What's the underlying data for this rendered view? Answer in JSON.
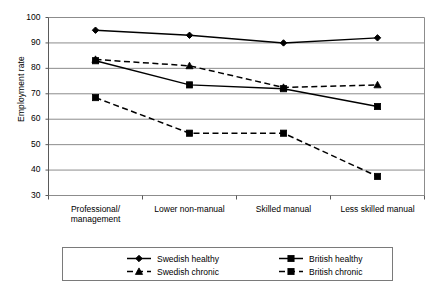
{
  "chart_data": {
    "type": "line",
    "title": "",
    "xlabel": "",
    "ylabel": "Employment rate",
    "ylim": [
      30,
      100
    ],
    "ytick_step": 10,
    "yticks": [
      100,
      90,
      80,
      70,
      60,
      50,
      40,
      30
    ],
    "grid": true,
    "legend_position": "bottom",
    "categories": [
      "Professional/ management",
      "Lower non-manual",
      "Skilled manual",
      "Less skilled manual"
    ],
    "category_lines": [
      [
        "Professional/",
        "management"
      ],
      [
        "Lower non-manual"
      ],
      [
        "Skilled manual"
      ],
      [
        "Less skilled manual"
      ]
    ],
    "series": [
      {
        "name": "Swedish healthy",
        "values": [
          95,
          93,
          90,
          92
        ],
        "style": "solid",
        "marker": "diamond",
        "color": "#000000"
      },
      {
        "name": "British healthy",
        "values": [
          83,
          73.5,
          72,
          65
        ],
        "style": "solid",
        "marker": "square",
        "color": "#000000"
      },
      {
        "name": "Swedish chronic",
        "values": [
          83.5,
          81,
          72.5,
          73.5
        ],
        "style": "dashed",
        "marker": "triangle",
        "color": "#000000"
      },
      {
        "name": "British chronic",
        "values": [
          68.5,
          54.5,
          54.5,
          37.5
        ],
        "style": "dashed",
        "marker": "square",
        "color": "#000000"
      }
    ]
  },
  "legend": {
    "entries": [
      {
        "label": "Swedish healthy",
        "style": "solid",
        "marker": "diamond"
      },
      {
        "label": "British healthy",
        "style": "solid",
        "marker": "square"
      },
      {
        "label": "Swedish chronic",
        "style": "dashed",
        "marker": "triangle"
      },
      {
        "label": "British chronic",
        "style": "dashed",
        "marker": "square"
      }
    ]
  },
  "axis": {
    "y_title": "Employment rate"
  }
}
